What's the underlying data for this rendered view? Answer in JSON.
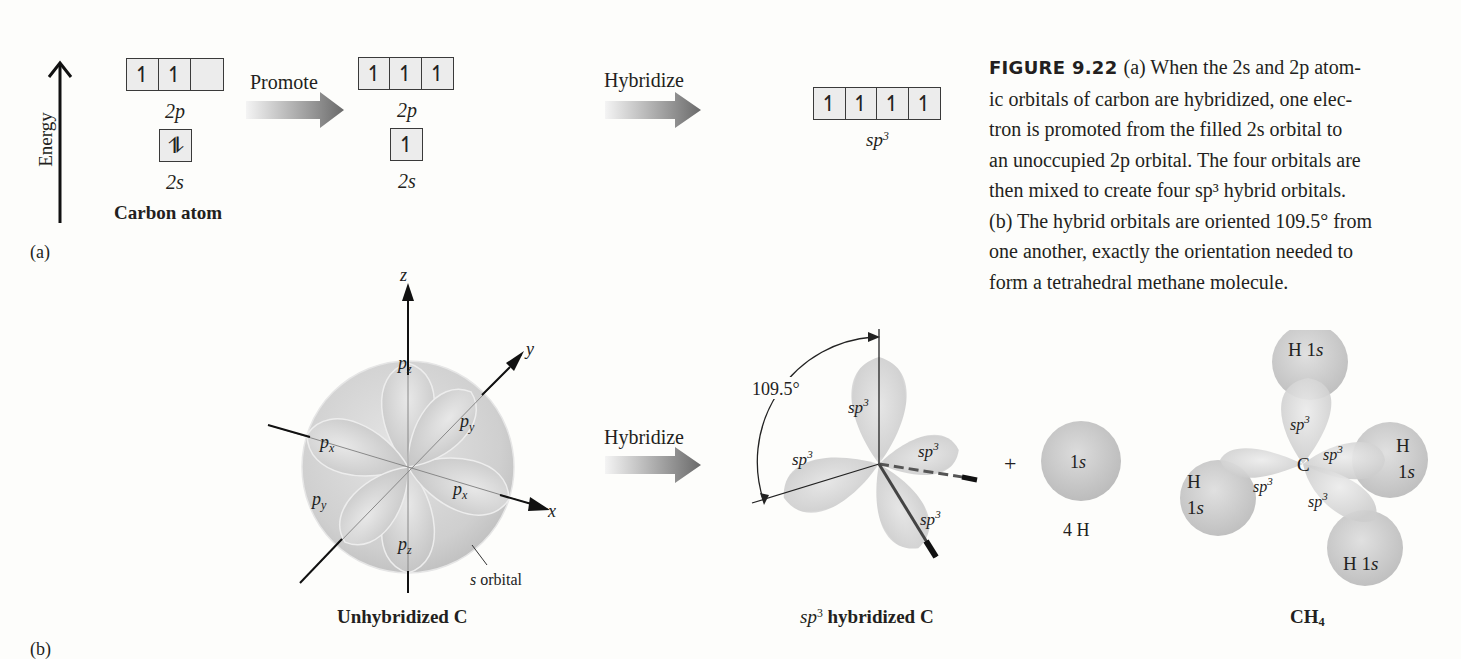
{
  "figure": {
    "number": "FIGURE 9.22",
    "caption_lines": [
      "(a) When the 2s and 2p atom-",
      "ic orbitals of carbon are hybridized, one elec-",
      "tron is promoted from the filled 2s orbital to",
      "an unoccupied 2p orbital. The four orbitals are",
      "then mixed to create four sp³ hybrid orbitals.",
      "(b) The hybrid orbitals are oriented 109.5° from",
      "one another, exactly the orientation needed to",
      "form a tetrahedral methane molecule."
    ]
  },
  "part_a": {
    "panel_label": "(a)",
    "energy_axis_label": "Energy",
    "carbon_atom": {
      "title": "Carbon atom",
      "p_label": "2p",
      "s_label": "2s",
      "p_cells": [
        "↿",
        "↿",
        ""
      ],
      "s_cells": [
        "⥮"
      ]
    },
    "promote_label": "Promote",
    "promoted": {
      "p_label": "2p",
      "s_label": "2s",
      "p_cells": [
        "↿",
        "↿",
        "↿"
      ],
      "s_cells": [
        "↿"
      ]
    },
    "hybridize_label": "Hybridize",
    "hybrid": {
      "label_base": "sp",
      "label_sup": "3",
      "cells": [
        "↿",
        "↿",
        "↿",
        "↿"
      ]
    },
    "arrow_color_start": "#f2f2f2",
    "arrow_color_end": "#6d6d6d"
  },
  "part_b": {
    "panel_label": "(b)",
    "unhybridized": {
      "title": "Unhybridized C",
      "axis_labels": {
        "z": "z",
        "y": "y",
        "x": "x"
      },
      "lobe_labels": [
        "pz",
        "py",
        "px",
        "px",
        "py",
        "pz"
      ],
      "s_orbital_label": "s orbital"
    },
    "hybridize_label": "Hybridize",
    "sp3_c": {
      "title_base": "sp",
      "title_sup": "3",
      "title_rest": " hybridized C",
      "angle_label": "109.5°",
      "lobe_label": "sp3"
    },
    "plus": "+",
    "hydrogen": {
      "orbital_label": "1s",
      "count_label": "4 H"
    },
    "methane": {
      "title": "CH4",
      "center_label": "C",
      "h_labels": [
        "H 1s",
        "H 1s",
        "H 1s",
        "H 1s"
      ],
      "bond_label": "sp3"
    }
  }
}
